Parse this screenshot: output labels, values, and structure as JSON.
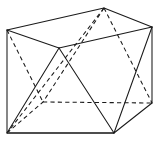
{
  "figure": {
    "type": "line-drawing",
    "canvas": {
      "width": 160,
      "height": 142,
      "background": "#ffffff"
    },
    "colors": {
      "visible_edge": "#1a1a1a",
      "hidden_edge": "#1a1a1a",
      "ground_edge": "#4d4d4d"
    },
    "vertices": [
      {
        "id": "top-left",
        "label": "A",
        "x": 7,
        "y": 30
      },
      {
        "id": "top-back",
        "label": "B",
        "x": 104,
        "y": 8
      },
      {
        "id": "top-right",
        "label": "C",
        "x": 152,
        "y": 27
      },
      {
        "id": "top-front",
        "label": "D",
        "x": 59,
        "y": 48
      },
      {
        "id": "bottom-left",
        "label": "E",
        "x": 7,
        "y": 133
      },
      {
        "id": "bottom-back",
        "label": "F",
        "x": 43,
        "y": 102
      },
      {
        "id": "bottom-right",
        "label": "G",
        "x": 152,
        "y": 103
      },
      {
        "id": "bottom-front",
        "label": "H",
        "x": 114,
        "y": 133
      }
    ],
    "edges": [
      {
        "id": "top-left-to-top-back",
        "from": "top-left",
        "to": "top-back",
        "style": "solid"
      },
      {
        "id": "top-back-to-top-right",
        "from": "top-back",
        "to": "top-right",
        "style": "solid"
      },
      {
        "id": "top-right-to-top-front",
        "from": "top-right",
        "to": "top-front",
        "style": "solid"
      },
      {
        "id": "top-front-to-top-left",
        "from": "top-front",
        "to": "top-left",
        "style": "solid"
      },
      {
        "id": "left-vertical",
        "from": "top-left",
        "to": "bottom-left",
        "style": "solid"
      },
      {
        "id": "right-vertical",
        "from": "top-right",
        "to": "bottom-right",
        "style": "solid"
      },
      {
        "id": "bottom-left-to-bottom-front",
        "from": "bottom-left",
        "to": "bottom-front",
        "style": "ground"
      },
      {
        "id": "bottom-back-to-bottom-right",
        "from": "bottom-back",
        "to": "bottom-right",
        "style": "hidden"
      },
      {
        "id": "bottom-left-to-bottom-back",
        "from": "bottom-left",
        "to": "bottom-back",
        "style": "hidden"
      },
      {
        "id": "bottom-front-to-bottom-right",
        "from": "bottom-front",
        "to": "bottom-right",
        "style": "solid"
      },
      {
        "id": "brace-top-front-to-bottom-left",
        "from": "top-front",
        "to": "bottom-left",
        "style": "solid"
      },
      {
        "id": "brace-top-front-to-bottom-front",
        "from": "top-front",
        "to": "bottom-front",
        "style": "solid"
      },
      {
        "id": "brace-top-right-to-bottom-front",
        "from": "top-right",
        "to": "bottom-front",
        "style": "solid"
      },
      {
        "id": "brace-top-left-to-bottom-back",
        "from": "top-left",
        "to": "bottom-back",
        "style": "hidden"
      },
      {
        "id": "brace-top-back-to-bottom-back",
        "from": "top-back",
        "to": "bottom-back",
        "style": "hidden"
      },
      {
        "id": "brace-top-back-to-bottom-left",
        "from": "top-back",
        "to": "bottom-left",
        "style": "hidden"
      },
      {
        "id": "brace-top-back-to-bottom-right",
        "from": "top-back",
        "to": "bottom-right",
        "style": "hidden"
      }
    ]
  }
}
